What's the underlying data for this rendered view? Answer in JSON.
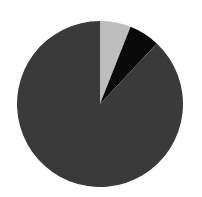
{
  "chart_data": {
    "type": "pie",
    "title": "",
    "categories": [
      "Slice A",
      "Slice B",
      "Slice C"
    ],
    "values": [
      6,
      6,
      88
    ],
    "colors": [
      "#bdbdbd",
      "#0a0a0a",
      "#3a3a3a"
    ],
    "start_angle_deg": 0,
    "direction": "clockwise",
    "legend": "none",
    "labels_shown": false
  },
  "layout": {
    "cx": 100,
    "cy": 104,
    "r": 83
  }
}
